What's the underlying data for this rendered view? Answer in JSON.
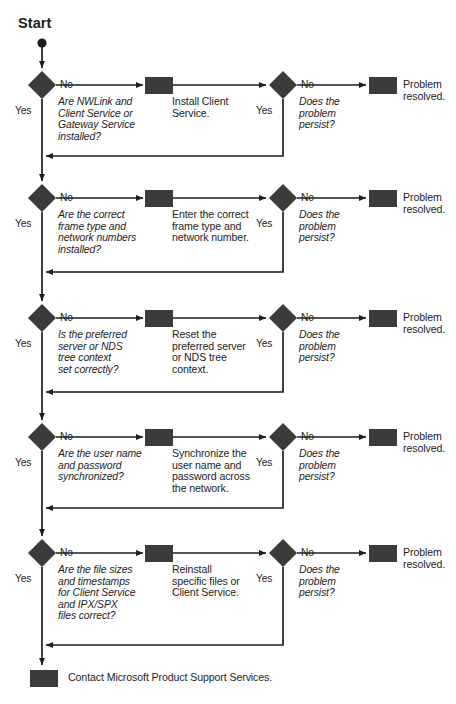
{
  "title": "Start",
  "colors": {
    "shape_fill": "#3b3b3b",
    "line": "#1d1d1d",
    "text": "#1d1d1d",
    "background": "#ffffff"
  },
  "start": {
    "label": "Start"
  },
  "branch_labels": {
    "yes": "Yes",
    "no": "No"
  },
  "recheck": {
    "question": "Does the\nproblem\npersist?",
    "resolved": "Problem\nresolved."
  },
  "rows": [
    {
      "id": "nwlink-client-gateway",
      "question": "Are NWLink and\nClient Service or\nGateway Service\ninstalled?",
      "action": "Install Client\nService.",
      "recheck_question": "Does the\nproblem\npersist?",
      "resolved": "Problem\nresolved.",
      "no_label": "No",
      "yes_label": "Yes",
      "recheck_no_label": "No",
      "recheck_yes_label": "Yes"
    },
    {
      "id": "frame-type-network-numbers",
      "question": "Are the correct\nframe type and\nnetwork numbers\ninstalled?",
      "action": "Enter the correct\nframe type and\nnetwork number.",
      "recheck_question": "Does the\nproblem\npersist?",
      "resolved": "Problem\nresolved.",
      "no_label": "No",
      "yes_label": "Yes",
      "recheck_no_label": "No",
      "recheck_yes_label": "Yes"
    },
    {
      "id": "preferred-server-nds-context",
      "question": "Is the preferred\nserver or NDS\ntree context\nset correctly?",
      "action": "Reset the\npreferred server\nor NDS tree\ncontext.",
      "recheck_question": "Does the\nproblem\npersist?",
      "resolved": "Problem\nresolved.",
      "no_label": "No",
      "yes_label": "Yes",
      "recheck_no_label": "No",
      "recheck_yes_label": "Yes"
    },
    {
      "id": "username-password-sync",
      "question": "Are the user name\nand password\nsynchronized?",
      "action": "Synchronize the\nuser name and\npassword across\nthe network.",
      "recheck_question": "Does the\nproblem\npersist?",
      "resolved": "Problem\nresolved.",
      "no_label": "No",
      "yes_label": "Yes",
      "recheck_no_label": "No",
      "recheck_yes_label": "Yes"
    },
    {
      "id": "file-sizes-timestamps",
      "question": "Are the file sizes\nand timestamps\nfor Client Service\nand IPX/SPX\nfiles correct?",
      "action": "Reinstall\nspecific files or\nClient Service.",
      "recheck_question": "Does the\nproblem\npersist?",
      "resolved": "Problem\nresolved.",
      "no_label": "No",
      "yes_label": "Yes",
      "recheck_no_label": "No",
      "recheck_yes_label": "Yes"
    }
  ],
  "footer": {
    "label": "Contact Microsoft Product Support Services."
  }
}
